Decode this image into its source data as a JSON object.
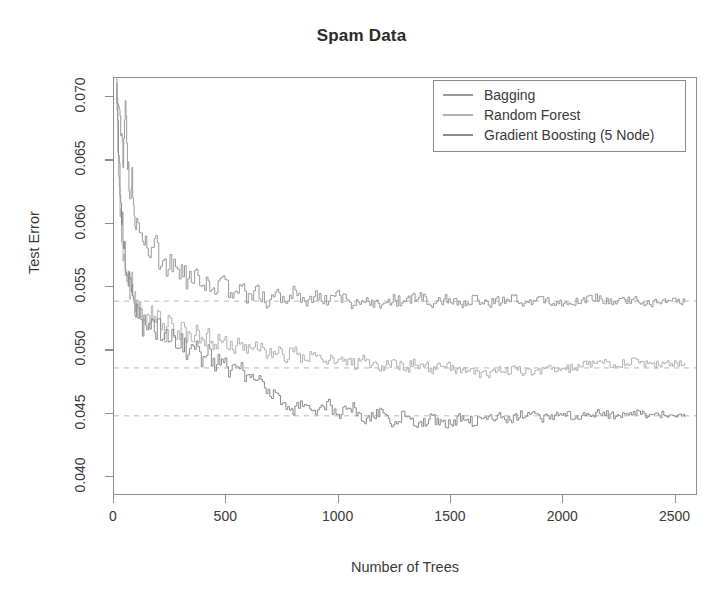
{
  "chart_data": {
    "type": "line",
    "title": "Spam Data",
    "xlabel": "Number of Trees",
    "ylabel": "Test Error",
    "xlim": [
      0,
      2600
    ],
    "ylim": [
      0.0385,
      0.0715
    ],
    "xticks": [
      0,
      500,
      1000,
      1500,
      2000,
      2500
    ],
    "xticklabels": [
      "0",
      "500",
      "1000",
      "1500",
      "2000",
      "2500"
    ],
    "yticks": [
      0.04,
      0.045,
      0.05,
      0.055,
      0.06,
      0.065,
      0.07
    ],
    "yticklabels": [
      "0.040",
      "0.045",
      "0.050",
      "0.055",
      "0.060",
      "0.065",
      "0.070"
    ],
    "grid": false,
    "legend_position": "top-right",
    "reference_lines": [
      {
        "name": "bagging-asymptote",
        "y": 0.0538,
        "style": "dashed",
        "color": "#b8b8b8"
      },
      {
        "name": "random-forest-asymptote",
        "y": 0.0485,
        "style": "dashed",
        "color": "#b8b8b8"
      },
      {
        "name": "gradient-boosting-asymptote",
        "y": 0.0447,
        "style": "dashed",
        "color": "#b8b8b8"
      }
    ],
    "series": [
      {
        "name": "Bagging",
        "color": "#9a9a9a",
        "asymptote": 0.0538,
        "x": [
          10,
          20,
          30,
          40,
          50,
          60,
          70,
          80,
          90,
          100,
          120,
          140,
          160,
          180,
          200,
          225,
          250,
          275,
          300,
          330,
          360,
          390,
          420,
          450,
          480,
          520,
          560,
          600,
          640,
          680,
          720,
          760,
          800,
          850,
          900,
          950,
          1000,
          1060,
          1120,
          1180,
          1240,
          1300,
          1360,
          1420,
          1480,
          1540,
          1600,
          1680,
          1760,
          1840,
          1920,
          2000,
          2080,
          2160,
          2240,
          2320,
          2400,
          2480,
          2550
        ],
        "y": [
          0.071,
          0.0695,
          0.0668,
          0.0652,
          0.069,
          0.0648,
          0.0622,
          0.0636,
          0.0608,
          0.0596,
          0.0601,
          0.0585,
          0.0578,
          0.059,
          0.0572,
          0.0563,
          0.0575,
          0.0558,
          0.0566,
          0.0552,
          0.056,
          0.0546,
          0.0555,
          0.0548,
          0.0556,
          0.0543,
          0.0551,
          0.054,
          0.0547,
          0.0536,
          0.0544,
          0.0538,
          0.0545,
          0.0535,
          0.0542,
          0.0537,
          0.0543,
          0.0536,
          0.0541,
          0.0535,
          0.054,
          0.0536,
          0.0542,
          0.0537,
          0.054,
          0.0535,
          0.0539,
          0.0536,
          0.0541,
          0.0537,
          0.054,
          0.0534,
          0.0538,
          0.0542,
          0.0536,
          0.054,
          0.0535,
          0.0538,
          0.0537
        ]
      },
      {
        "name": "Random Forest",
        "color": "#b2b2b2",
        "asymptote": 0.0485,
        "x": [
          10,
          20,
          30,
          40,
          50,
          60,
          70,
          80,
          90,
          100,
          120,
          140,
          160,
          180,
          200,
          225,
          250,
          275,
          300,
          330,
          360,
          390,
          420,
          450,
          480,
          520,
          560,
          600,
          640,
          680,
          720,
          760,
          800,
          850,
          900,
          950,
          1000,
          1060,
          1120,
          1180,
          1240,
          1300,
          1360,
          1420,
          1480,
          1540,
          1600,
          1680,
          1760,
          1840,
          1920,
          2000,
          2080,
          2160,
          2240,
          2320,
          2400,
          2480,
          2550
        ],
        "y": [
          0.07,
          0.064,
          0.0602,
          0.058,
          0.0566,
          0.0556,
          0.0547,
          0.0552,
          0.054,
          0.0534,
          0.0528,
          0.0522,
          0.053,
          0.0518,
          0.0524,
          0.0514,
          0.052,
          0.0512,
          0.0517,
          0.0508,
          0.0514,
          0.0505,
          0.0511,
          0.0503,
          0.0508,
          0.05,
          0.0506,
          0.0498,
          0.0503,
          0.0495,
          0.05,
          0.0493,
          0.0498,
          0.0491,
          0.0496,
          0.0489,
          0.0494,
          0.0487,
          0.0492,
          0.0486,
          0.049,
          0.0485,
          0.0489,
          0.0483,
          0.0488,
          0.0482,
          0.0481,
          0.048,
          0.0483,
          0.0481,
          0.0484,
          0.0482,
          0.0487,
          0.0491,
          0.0489,
          0.0493,
          0.0488,
          0.0492,
          0.0489
        ]
      },
      {
        "name": "Gradient Boosting (5 Node)",
        "color": "#8c8c8c",
        "asymptote": 0.0447,
        "x": [
          10,
          20,
          30,
          40,
          50,
          60,
          70,
          80,
          90,
          100,
          120,
          140,
          160,
          180,
          200,
          225,
          250,
          275,
          300,
          330,
          360,
          390,
          420,
          450,
          480,
          520,
          560,
          600,
          640,
          680,
          720,
          760,
          800,
          850,
          900,
          950,
          1000,
          1060,
          1120,
          1180,
          1240,
          1300,
          1360,
          1420,
          1480,
          1540,
          1600,
          1680,
          1760,
          1840,
          1920,
          2000,
          2080,
          2160,
          2240,
          2320,
          2400,
          2480,
          2550
        ],
        "y": [
          0.0705,
          0.066,
          0.0618,
          0.0592,
          0.0574,
          0.056,
          0.055,
          0.0542,
          0.0536,
          0.053,
          0.0522,
          0.0516,
          0.0524,
          0.051,
          0.0518,
          0.0506,
          0.0513,
          0.0501,
          0.0508,
          0.0496,
          0.0503,
          0.049,
          0.0497,
          0.0486,
          0.0492,
          0.048,
          0.0486,
          0.0474,
          0.0481,
          0.0468,
          0.0462,
          0.0456,
          0.0452,
          0.046,
          0.045,
          0.0457,
          0.0448,
          0.0454,
          0.0444,
          0.0451,
          0.0441,
          0.0448,
          0.044,
          0.0446,
          0.0438,
          0.0445,
          0.0442,
          0.0448,
          0.0443,
          0.0449,
          0.0444,
          0.045,
          0.0445,
          0.0451,
          0.0446,
          0.0452,
          0.0447,
          0.045,
          0.0446
        ]
      }
    ]
  },
  "legend": {
    "entries": [
      {
        "label": "Bagging"
      },
      {
        "label": "Random Forest"
      },
      {
        "label": "Gradient Boosting (5 Node)"
      }
    ]
  }
}
